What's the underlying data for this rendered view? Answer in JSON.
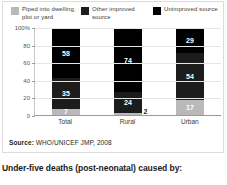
{
  "figure": {
    "source_prefix": "Source:",
    "source_text": "WHO/UNICEF JMP, 2008",
    "caption": "Under-five deaths (post-neonatal) caused by:"
  },
  "legend": {
    "items": [
      {
        "label": "Piped into dwelling, plot or yard",
        "color": "#b9b9b9",
        "icon": "legend-swatch-icon"
      },
      {
        "label": "Other improved source",
        "color": "#1c1c1c",
        "icon": "legend-swatch-icon"
      },
      {
        "label": "Unimproved source",
        "color": "#000000",
        "icon": "legend-swatch-icon"
      }
    ]
  },
  "chart_data": {
    "type": "bar",
    "subtype": "stacked",
    "title": "",
    "xlabel": "",
    "ylabel": "",
    "ylim": [
      0,
      100
    ],
    "yticks": [
      "100%",
      "80",
      "60",
      "40",
      "20",
      "0"
    ],
    "ytick_values": [
      100,
      80,
      60,
      40,
      20,
      0
    ],
    "grid": true,
    "legend_position": "top",
    "categories": [
      "Total",
      "Rural",
      "Urban"
    ],
    "series": [
      {
        "name": "Piped into dwelling, plot or yard",
        "color": "#b9b9b9",
        "values": [
          7,
          2,
          17
        ]
      },
      {
        "name": "Other improved source",
        "color": "#1c1c1c",
        "values": [
          35,
          24,
          54
        ]
      },
      {
        "name": "Unimproved source",
        "color": "#000000",
        "values": [
          58,
          74,
          29
        ]
      }
    ],
    "labels": {
      "Total": {
        "piped": "7",
        "other": "35",
        "unimproved": "58"
      },
      "Rural": {
        "piped": "2",
        "other": "24",
        "unimproved": "74"
      },
      "Urban": {
        "piped": "17",
        "other": "54",
        "unimproved": "29"
      }
    }
  }
}
